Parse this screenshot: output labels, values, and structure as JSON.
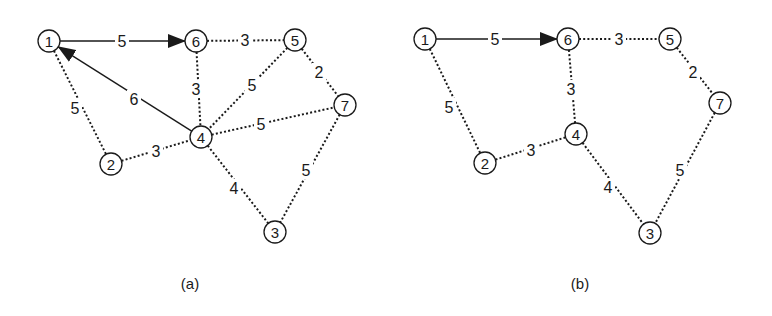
{
  "diagrams": [
    {
      "id": "a",
      "caption": "(a)",
      "caption_pos": [
        190,
        283
      ],
      "nodes": [
        {
          "id": "1",
          "label": "1",
          "x": 49,
          "y": 41
        },
        {
          "id": "6",
          "label": "6",
          "x": 196,
          "y": 41
        },
        {
          "id": "5",
          "label": "5",
          "x": 295,
          "y": 40
        },
        {
          "id": "7",
          "label": "7",
          "x": 345,
          "y": 105
        },
        {
          "id": "4",
          "label": "4",
          "x": 201,
          "y": 137
        },
        {
          "id": "2",
          "label": "2",
          "x": 111,
          "y": 164
        },
        {
          "id": "3",
          "label": "3",
          "x": 275,
          "y": 232
        }
      ],
      "edges": [
        {
          "from": "1",
          "to": "6",
          "weight": "5",
          "style": "solid",
          "arrow": "to",
          "label_pos": [
            122,
            41
          ]
        },
        {
          "from": "4",
          "to": "1",
          "weight": "6",
          "style": "solid",
          "arrow": "to",
          "label_pos": [
            134,
            99
          ]
        },
        {
          "from": "1",
          "to": "2",
          "weight": "5",
          "style": "dotted",
          "arrow": "none",
          "label_pos": [
            75,
            108
          ]
        },
        {
          "from": "6",
          "to": "5",
          "weight": "3",
          "style": "dotted",
          "arrow": "none",
          "label_pos": [
            245,
            40
          ]
        },
        {
          "from": "6",
          "to": "4",
          "weight": "3",
          "style": "dotted",
          "arrow": "none",
          "label_pos": [
            196,
            89
          ]
        },
        {
          "from": "5",
          "to": "4",
          "weight": "5",
          "style": "dotted",
          "arrow": "none",
          "label_pos": [
            252,
            85
          ]
        },
        {
          "from": "5",
          "to": "7",
          "weight": "2",
          "style": "dotted",
          "arrow": "none",
          "label_pos": [
            319,
            72
          ]
        },
        {
          "from": "4",
          "to": "7",
          "weight": "5",
          "style": "dotted",
          "arrow": "none",
          "label_pos": [
            261,
            124
          ]
        },
        {
          "from": "2",
          "to": "4",
          "weight": "3",
          "style": "dotted",
          "arrow": "none",
          "label_pos": [
            156,
            151
          ]
        },
        {
          "from": "4",
          "to": "3",
          "weight": "4",
          "style": "dotted",
          "arrow": "none",
          "label_pos": [
            234,
            188
          ]
        },
        {
          "from": "7",
          "to": "3",
          "weight": "5",
          "style": "dotted",
          "arrow": "none",
          "label_pos": [
            306,
            170
          ]
        }
      ]
    },
    {
      "id": "b",
      "caption": "(b)",
      "caption_pos": [
        580,
        283
      ],
      "nodes": [
        {
          "id": "1",
          "label": "1",
          "x": 425,
          "y": 39
        },
        {
          "id": "6",
          "label": "6",
          "x": 568,
          "y": 39
        },
        {
          "id": "5",
          "label": "5",
          "x": 670,
          "y": 39
        },
        {
          "id": "7",
          "label": "7",
          "x": 720,
          "y": 103
        },
        {
          "id": "4",
          "label": "4",
          "x": 576,
          "y": 134
        },
        {
          "id": "2",
          "label": "2",
          "x": 485,
          "y": 163
        },
        {
          "id": "3",
          "label": "3",
          "x": 650,
          "y": 233
        }
      ],
      "edges": [
        {
          "from": "1",
          "to": "6",
          "weight": "5",
          "style": "solid",
          "arrow": "to",
          "label_pos": [
            495,
            39
          ]
        },
        {
          "from": "1",
          "to": "2",
          "weight": "5",
          "style": "dotted",
          "arrow": "none",
          "label_pos": [
            449,
            107
          ]
        },
        {
          "from": "6",
          "to": "5",
          "weight": "3",
          "style": "dotted",
          "arrow": "none",
          "label_pos": [
            619,
            39
          ]
        },
        {
          "from": "6",
          "to": "4",
          "weight": "3",
          "style": "dotted",
          "arrow": "none",
          "label_pos": [
            571,
            89
          ]
        },
        {
          "from": "5",
          "to": "7",
          "weight": "2",
          "style": "dotted",
          "arrow": "none",
          "label_pos": [
            693,
            72
          ]
        },
        {
          "from": "2",
          "to": "4",
          "weight": "3",
          "style": "dotted",
          "arrow": "none",
          "label_pos": [
            531,
            150
          ]
        },
        {
          "from": "4",
          "to": "3",
          "weight": "4",
          "style": "dotted",
          "arrow": "none",
          "label_pos": [
            608,
            187
          ]
        },
        {
          "from": "7",
          "to": "3",
          "weight": "5",
          "style": "dotted",
          "arrow": "none",
          "label_pos": [
            680,
            170
          ]
        }
      ]
    }
  ],
  "node_radius": 11,
  "colors": {
    "stroke": "#1a1a1a",
    "background": "#ffffff"
  }
}
